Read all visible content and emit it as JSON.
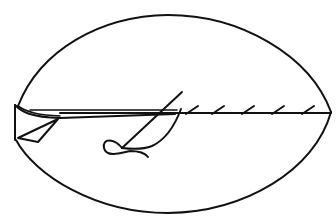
{
  "figure": {
    "type": "line-drawing",
    "colors": {
      "line": "#111111",
      "background": "#ffffff"
    },
    "elements": {
      "outline": "lens-shaped fabric piece",
      "fold": "folded fabric edge at left",
      "seam": "horizontal seam line",
      "stitches_count": 5,
      "needle": "diagonal needle",
      "thread": "thread loop"
    }
  }
}
